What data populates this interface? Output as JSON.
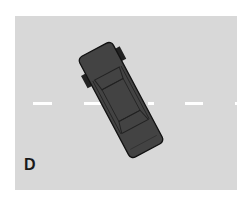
{
  "figure": {
    "label": "D",
    "background_color": "#d8d8d8",
    "car_color": "#434343",
    "line_color": "#ffffff"
  }
}
